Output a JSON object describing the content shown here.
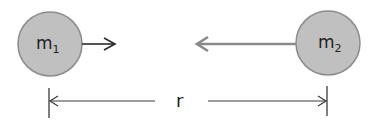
{
  "diagram": {
    "mass1": {
      "label": "m",
      "subscript": "1"
    },
    "mass2": {
      "label": "m",
      "subscript": "2"
    },
    "distance_label": "r",
    "colors": {
      "circle_fill": "#c0c0c0",
      "circle_stroke": "#8c8c8c",
      "arrow1": "#2a2a2a",
      "arrow2": "#8a8a8a",
      "dimension_line": "#3a3a3a"
    }
  }
}
